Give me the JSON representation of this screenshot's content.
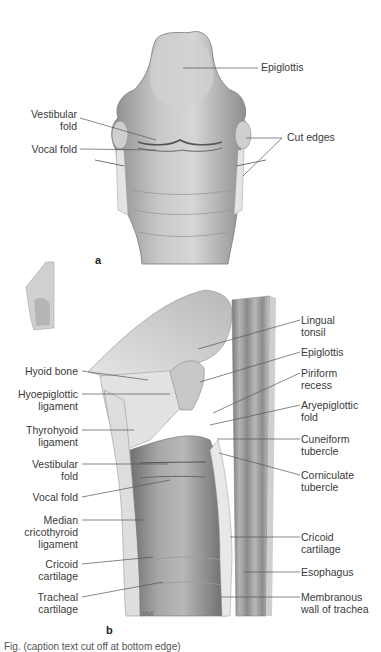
{
  "figure": {
    "panel_a": {
      "letter": "a",
      "labels": {
        "epiglottis": "Epiglottis",
        "vestibular_fold": "Vestibular\nfold",
        "vocal_fold": "Vocal fold",
        "cut_edges": "Cut edges"
      }
    },
    "panel_b": {
      "letter": "b",
      "signature": "Voll",
      "left_labels": {
        "hyoid_bone": "Hyoid bone",
        "hyoepiglottic_ligament": "Hyoepiglottic\nligament",
        "thyrohyoid_ligament": "Thyrohyoid\nligament",
        "vestibular_fold": "Vestibular\nfold",
        "vocal_fold": "Vocal fold",
        "median_cricothyroid_ligament": "Median\ncricothyroid\nligament",
        "cricoid_cartilage": "Cricoid\ncartilage",
        "tracheal_cartilage": "Tracheal\ncartilage"
      },
      "right_labels": {
        "lingual_tonsil": "Lingual\ntonsil",
        "epiglottis": "Epiglottis",
        "piriform_recess": "Piriform\nrecess",
        "aryepiglottic_fold": "Aryepiglottic\nfold",
        "cuneiform_tubercle": "Cuneiform\ntubercle",
        "corniculate_tubercle": "Corniculate\ntubercle",
        "cricoid_cartilage": "Cricoid\ncartilage",
        "esophagus": "Esophagus",
        "membranous_wall_of_trachea": "Membranous\nwall of trachea"
      }
    },
    "caption_clipped": "Fig. (caption text cut off at bottom edge)"
  }
}
